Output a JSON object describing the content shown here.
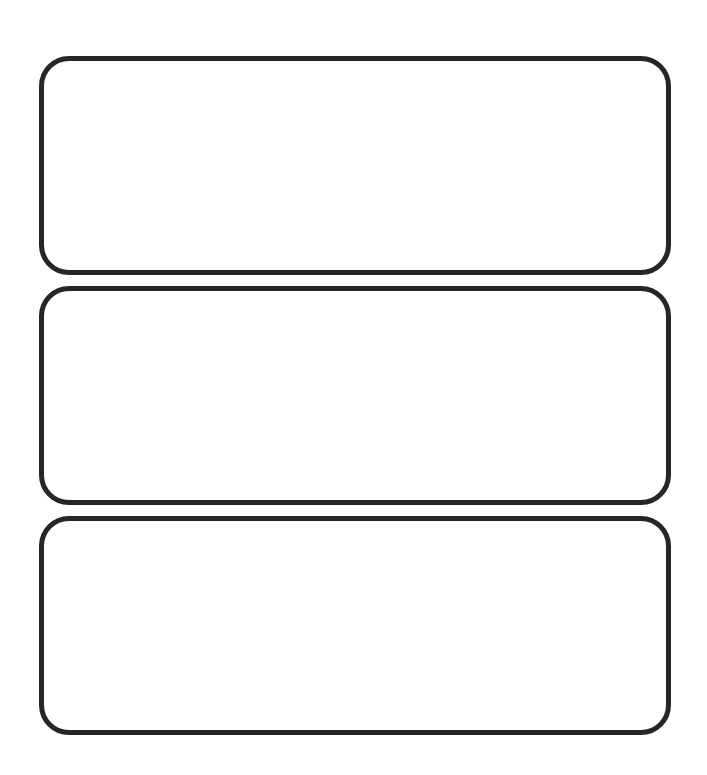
{
  "canvas": {
    "width": 707,
    "height": 775,
    "background": "#ffffff"
  },
  "style": {
    "border_color": "#262626",
    "border_width": 5,
    "corner_radius": 30
  },
  "panels": [
    {
      "id": "panel-1",
      "label": ""
    },
    {
      "id": "panel-2",
      "label": ""
    },
    {
      "id": "panel-3",
      "label": ""
    }
  ]
}
